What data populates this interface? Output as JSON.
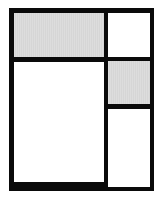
{
  "diagram": {
    "type": "grid-layout",
    "colors": {
      "border": "#0a0a0a",
      "gray_fill": "#d6d6d6",
      "white_fill": "#ffffff"
    },
    "cells": [
      {
        "id": "top-left",
        "fill": "gray"
      },
      {
        "id": "top-right",
        "fill": "white"
      },
      {
        "id": "bottom-left",
        "fill": "white"
      },
      {
        "id": "middle-right",
        "fill": "gray"
      },
      {
        "id": "bottom-right",
        "fill": "white"
      }
    ]
  }
}
